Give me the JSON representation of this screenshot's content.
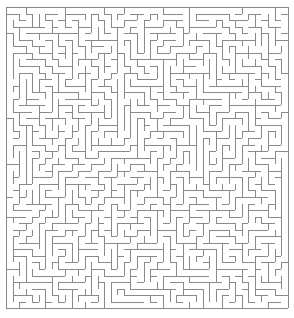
{
  "figure": {
    "name": "maze-figure",
    "type": "maze",
    "caption": "",
    "width": 294,
    "height": 318
  },
  "maze": {
    "kind": "perfect-maze",
    "algorithm": "depth-first-search",
    "seed": 20240517,
    "columns": 43,
    "rows": 46,
    "cell_size": 6.55,
    "origin_x": 6,
    "origin_y": 7,
    "wall_color": "#8a8a8a",
    "wall_width": 1,
    "background_color": "#ffffff",
    "border_closed": true,
    "entrance": "",
    "exit": ""
  }
}
